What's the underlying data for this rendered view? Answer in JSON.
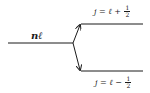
{
  "diagram": {
    "type": "energy-level-splitting",
    "stroke_color": "#1a1a1a",
    "background": "#ffffff",
    "parent_level": {
      "label": "nℓ"
    },
    "upper_level": {
      "prefix": "j = ℓ +",
      "frac_num": "1",
      "frac_den": "2"
    },
    "lower_level": {
      "prefix": "j = ℓ −",
      "frac_num": "1",
      "frac_den": "2"
    }
  }
}
